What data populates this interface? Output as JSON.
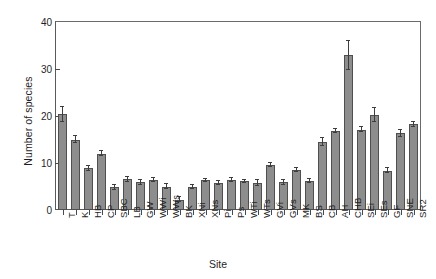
{
  "chart_data": {
    "type": "bar",
    "title": "",
    "xlabel": "Site",
    "ylabel": "Number of species",
    "ylim": [
      0,
      40
    ],
    "yticks": [
      0,
      10,
      20,
      30,
      40
    ],
    "grid": false,
    "legend": null,
    "error_bars": "present (upper and lower caps)",
    "categories": [
      "T",
      "K",
      "HB",
      "CP",
      "SBC",
      "LB",
      "GW",
      "WWi",
      "WWs",
      "BK",
      "XNi",
      "XNs",
      "Pi",
      "Ps",
      "WTi",
      "WTs",
      "GVi",
      "GVs",
      "MK",
      "BS",
      "CB",
      "AH",
      "CHB",
      "SEi",
      "SEs",
      "GF",
      "SNE",
      "SR2"
    ],
    "values": [
      20.4,
      15.0,
      8.9,
      12.0,
      4.8,
      6.5,
      5.9,
      6.4,
      5.0,
      2.2,
      4.9,
      6.3,
      5.7,
      6.4,
      6.1,
      5.7,
      9.5,
      5.9,
      8.5,
      6.2,
      14.5,
      16.8,
      32.9,
      17.1,
      20.3,
      8.4,
      16.3,
      18.2
    ],
    "errors": [
      1.6,
      0.7,
      0.5,
      0.6,
      0.5,
      0.6,
      0.5,
      0.4,
      0.6,
      0.5,
      0.5,
      0.4,
      0.4,
      0.5,
      0.3,
      0.6,
      0.4,
      0.5,
      0.4,
      0.4,
      0.9,
      0.5,
      3.1,
      0.6,
      1.5,
      0.5,
      0.7,
      0.6
    ]
  },
  "axis": {
    "y_tick_labels": [
      "0",
      "10",
      "20",
      "30",
      "40"
    ],
    "y_title": "Number of species",
    "x_title": "Site"
  },
  "colors": {
    "bar_fill": "#8d8d8d",
    "bar_edge": "#4f4f4f",
    "axis": "#5a5a5a",
    "text": "#1f1f1f",
    "background": "#ffffff"
  }
}
